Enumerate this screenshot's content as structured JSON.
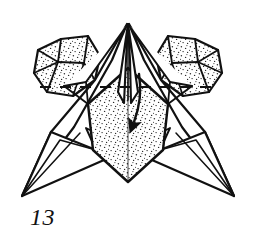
{
  "figure": {
    "kind": "origami-folding-diagram",
    "step_label": "13",
    "background_color": "#ffffff",
    "ink_color": "#111111",
    "stipple_color": "#222222",
    "fill_color": "#ffffff",
    "title": "Origami step 13 diagram"
  },
  "annotations": {
    "fold_line": {
      "name": "valley-fold-dashed-line",
      "style": "dashed",
      "orientation": "horizontal",
      "label": ""
    },
    "fold_arrow": {
      "name": "fold-down-arrow",
      "direction": "down",
      "label": ""
    }
  },
  "parts": [
    {
      "id": "left-wing",
      "label": "left wing flap",
      "shaded": true
    },
    {
      "id": "right-wing",
      "label": "right wing flap",
      "shaded": true
    },
    {
      "id": "center-kite",
      "label": "central kite panel",
      "shaded": true
    },
    {
      "id": "left-point",
      "label": "left lower point",
      "shaded": false
    },
    {
      "id": "right-point",
      "label": "right lower point",
      "shaded": false
    },
    {
      "id": "center-spike",
      "label": "central apex spike",
      "shaded": false
    }
  ]
}
